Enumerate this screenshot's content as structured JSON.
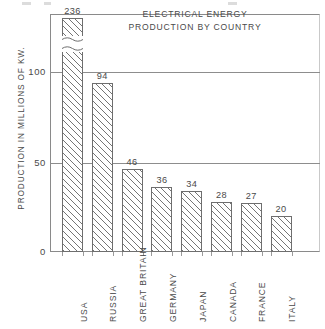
{
  "chart_data": {
    "type": "bar",
    "title": "ELECTRICAL ENERGY PRODUCTION BY COUNTRY",
    "title_lines": [
      "ELECTRICAL  ENERGY",
      "PRODUCTION  BY  COUNTRY"
    ],
    "xlabel": "",
    "ylabel": "PRODUCTION  IN  MILLIONS  OF  KW.",
    "categories": [
      "USA",
      "RUSSIA",
      "GREAT  BRITAIN",
      "GERMANY",
      "JAPAN",
      "CANADA",
      "FRANCE",
      "ITALY"
    ],
    "values": [
      236,
      94,
      46,
      36,
      34,
      28,
      27,
      20
    ],
    "value_labels": [
      "236",
      "94",
      "46",
      "36",
      "34",
      "28",
      "27",
      "20"
    ],
    "ylim": [
      0,
      130
    ],
    "yticks": [
      0,
      50,
      100
    ],
    "ytick_labels": [
      "0",
      "50",
      "100"
    ],
    "grid": true,
    "grid_axis": "y",
    "legend": false,
    "broken_axis": {
      "applies_to": "USA",
      "note": "USA bar is drawn with an axis break; its true value 236 exceeds the plotted scale."
    },
    "bar_style": {
      "fill": "#ffffff",
      "hatch": "diagonal-forward-slash",
      "edge_color": "#6e6e6e"
    },
    "colors": {
      "axis": "#8a8a8a",
      "grid": "#8d8d8d",
      "text": "#4a4a4a",
      "background": "#ffffff"
    }
  }
}
